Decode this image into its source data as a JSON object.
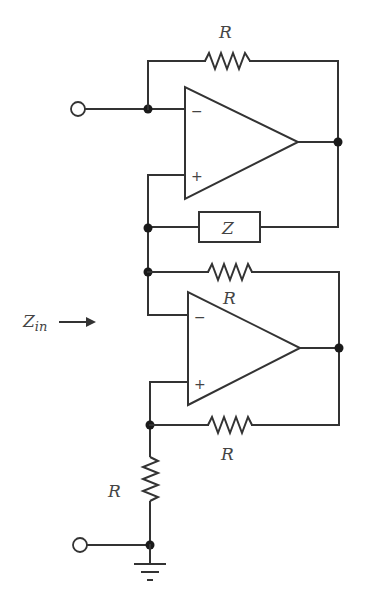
{
  "diagram": {
    "type": "circuit-schematic",
    "colors": {
      "line": "#333333",
      "node": "#1a1a1a",
      "label": "#444444",
      "background": "#ffffff"
    },
    "labels": {
      "top_resistor": "R",
      "impedance_box": "Z",
      "middle_resistor": "R",
      "bottom_resistor": "R",
      "vertical_resistor": "R",
      "input_impedance": "Z",
      "input_impedance_sub": "in"
    },
    "opamps": [
      {
        "name": "top-opamp",
        "inverting": "−",
        "noninverting": "+"
      },
      {
        "name": "bottom-opamp",
        "inverting": "−",
        "noninverting": "+"
      }
    ],
    "components": [
      {
        "kind": "resistor",
        "label": "R",
        "position": "top feedback of upper op-amp"
      },
      {
        "kind": "impedance",
        "label": "Z",
        "position": "between upper op-amp output and middle node"
      },
      {
        "kind": "resistor",
        "label": "R",
        "position": "between middle node and lower op-amp output"
      },
      {
        "kind": "resistor",
        "label": "R",
        "position": "between lower op-amp output and lower node"
      },
      {
        "kind": "resistor",
        "label": "R",
        "position": "lower node to ground"
      }
    ],
    "terminals": [
      "input-terminal-top",
      "input-terminal-bottom"
    ],
    "ground": "ground-symbol"
  }
}
